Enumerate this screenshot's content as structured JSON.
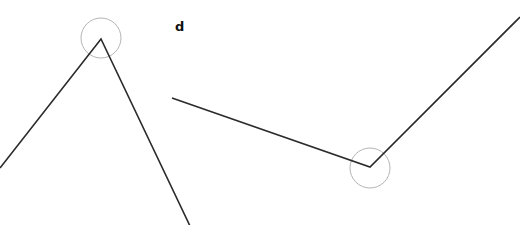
{
  "diagram": {
    "type": "angles",
    "background": "#ffffff",
    "line_color": "#2b2b2b",
    "arc_color": "#b5b5b5",
    "label": {
      "text": "d",
      "x": 175,
      "y": 20
    },
    "angles": [
      {
        "id": "angle-left",
        "vertex": [
          101,
          39
        ],
        "arm1_end": [
          0,
          168
        ],
        "arm2_end": [
          190,
          226
        ],
        "marker_circle": {
          "cx": 101,
          "cy": 38,
          "r": 20
        }
      },
      {
        "id": "angle-right",
        "vertex": [
          370,
          167
        ],
        "arm1_end": [
          172,
          98
        ],
        "arm2_end": [
          520,
          17
        ],
        "marker_circle": {
          "cx": 370,
          "cy": 168,
          "r": 20
        }
      }
    ]
  }
}
